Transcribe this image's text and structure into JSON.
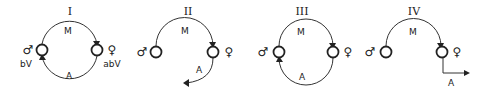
{
  "diagram": {
    "panels": [
      {
        "numeral": "I",
        "top_arrow_label": "M",
        "bottom_arrow_label": "A",
        "left_symbol": "♂",
        "right_symbol": "♀",
        "left_caption": "bV",
        "right_caption": "abV",
        "bottom_path": "closed-arc-back-to-male"
      },
      {
        "numeral": "II",
        "top_arrow_label": "M",
        "bottom_arrow_label": "A",
        "left_symbol": "♂",
        "right_symbol": "♀",
        "bottom_path": "open-arc-down-left"
      },
      {
        "numeral": "III",
        "top_arrow_label": "M",
        "bottom_arrow_label": "A",
        "left_symbol": "♂",
        "right_symbol": "♀",
        "bottom_path": "closed-arc-back-to-male"
      },
      {
        "numeral": "IV",
        "top_arrow_label": "M",
        "bottom_arrow_label": "A",
        "left_symbol": "♂",
        "right_symbol": "♀",
        "bottom_path": "right-angle-out-right"
      }
    ],
    "colors": {
      "ink": "#222222",
      "background": "#ffffff"
    }
  }
}
